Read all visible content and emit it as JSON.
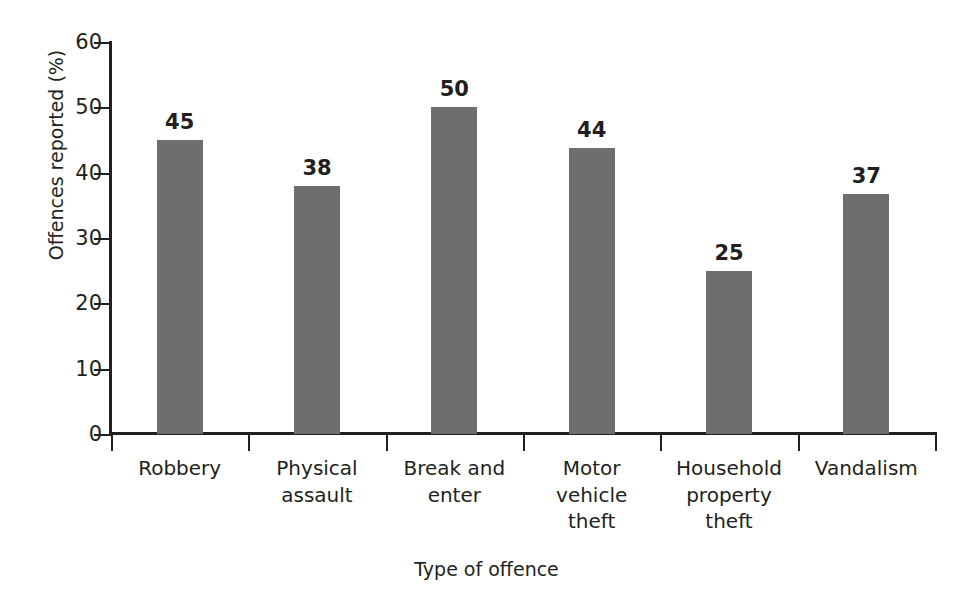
{
  "chart_data": {
    "type": "bar",
    "title": "",
    "xlabel": "Type of offence",
    "ylabel": "Offences reported (%)",
    "categories": [
      "Robbery",
      "Physical assault",
      "Break and enter",
      "Motor vehicle theft",
      "Household property theft",
      "Vandalism"
    ],
    "category_lines": [
      [
        "Robbery"
      ],
      [
        "Physical",
        "assault"
      ],
      [
        "Break and",
        "enter"
      ],
      [
        "Motor",
        "vehicle",
        "theft"
      ],
      [
        "Household",
        "property",
        "theft"
      ],
      [
        "Vandalism"
      ]
    ],
    "values": [
      45,
      38,
      50,
      44,
      25,
      37
    ],
    "value_labels": [
      "45",
      "38",
      "50",
      "44",
      "25",
      "37"
    ],
    "plotted_values": [
      45,
      38,
      50,
      43.8,
      24.9,
      36.7
    ],
    "ylim": [
      0,
      60
    ],
    "yticks": [
      0,
      10,
      20,
      30,
      40,
      50,
      60
    ],
    "ytick_labels": [
      "0",
      "10",
      "20",
      "30",
      "40",
      "50",
      "60"
    ],
    "grid": false,
    "legend": false,
    "bar_color": "#6e6e6e",
    "axis_color": "#231f20",
    "text_color": "#231f20",
    "background_color": "#ffffff"
  }
}
